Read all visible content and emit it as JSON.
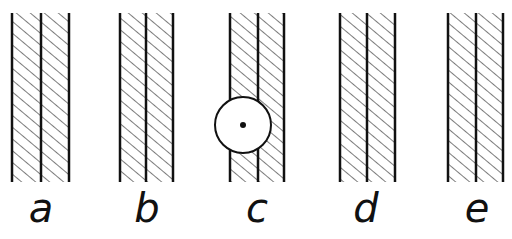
{
  "diagram": {
    "colors": {
      "line": "#111111",
      "background": "#ffffff"
    },
    "strips": [
      {
        "label": "a",
        "lines_x": [
          12,
          41,
          69
        ],
        "has_circle": false
      },
      {
        "label": "b",
        "lines_x": [
          120,
          146,
          173
        ],
        "has_circle": false
      },
      {
        "label": "c",
        "lines_x": [
          230,
          258,
          284
        ],
        "has_circle": true,
        "circle": {
          "cx": 243,
          "cy": 125,
          "r": 28
        }
      },
      {
        "label": "d",
        "lines_x": [
          340,
          367,
          395
        ],
        "has_circle": false
      },
      {
        "label": "e",
        "lines_x": [
          448,
          476,
          503
        ],
        "has_circle": false
      }
    ],
    "y_top": 13,
    "y_bottom": 182
  }
}
